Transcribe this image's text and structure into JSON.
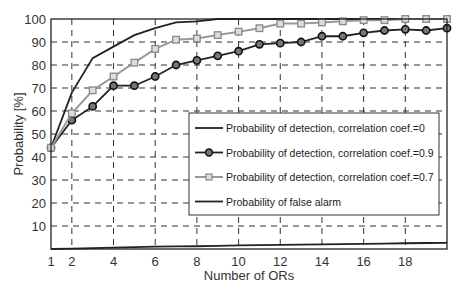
{
  "chart_data": {
    "type": "line",
    "title": "",
    "xlabel": "Number of ORs",
    "ylabel": "Probability [%]",
    "xlim": [
      1,
      20
    ],
    "ylim": [
      0,
      100
    ],
    "grid": true,
    "legend_position": "lower right (inside)",
    "xticks": [
      1,
      2,
      4,
      6,
      8,
      10,
      12,
      14,
      16,
      18
    ],
    "yticks": [
      10,
      20,
      30,
      40,
      50,
      60,
      70,
      80,
      90,
      100
    ],
    "x": [
      1,
      2,
      3,
      4,
      5,
      6,
      7,
      8,
      9,
      10,
      11,
      12,
      13,
      14,
      15,
      16,
      17,
      18,
      19,
      20
    ],
    "series": [
      {
        "name": "Probability of detection, correlation coef.=0",
        "color": "#222222",
        "marker": "none",
        "values": [
          44,
          68,
          83,
          88,
          93,
          96,
          98.5,
          99,
          100,
          100,
          100,
          100,
          100,
          100,
          100,
          100,
          100,
          100,
          100,
          100
        ]
      },
      {
        "name": "Probability of detection, correlation coef.=0.9",
        "color": "#222222",
        "marker": "circle",
        "values": [
          44,
          56,
          62,
          71,
          71,
          75,
          80,
          82,
          84,
          86,
          89,
          89.5,
          90,
          92.5,
          92.5,
          94,
          95,
          95.5,
          95,
          96
        ]
      },
      {
        "name": "Probability of detection, correlation coef.=0.7",
        "color": "#999999",
        "marker": "square",
        "values": [
          44,
          59,
          69,
          75,
          81,
          87,
          91,
          91.5,
          93,
          94.5,
          96,
          98,
          98,
          98.5,
          99,
          99.5,
          99.5,
          100,
          100,
          100
        ]
      },
      {
        "name": "Probability of false alarm",
        "color": "#222222",
        "marker": "none",
        "values": [
          0,
          0.2,
          0.4,
          0.6,
          0.8,
          1,
          1.1,
          1.2,
          1.4,
          1.6,
          1.7,
          1.8,
          1.9,
          2,
          2.1,
          2.2,
          2.3,
          2.5,
          2.6,
          2.7
        ]
      }
    ]
  }
}
